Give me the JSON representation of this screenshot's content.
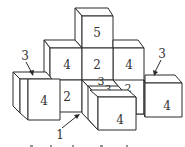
{
  "diagram": {
    "type": "isometric cube stack",
    "colors": {
      "stroke": "#2a2a2a",
      "fill": "#ffffff",
      "text": "#333333"
    },
    "cubes": [
      {
        "id": "top-center",
        "label": "5"
      },
      {
        "id": "middle-left",
        "label": "4"
      },
      {
        "id": "middle-center",
        "label": "2"
      },
      {
        "id": "middle-right",
        "label": "4"
      },
      {
        "id": "lower-center-left",
        "label": "2"
      },
      {
        "id": "far-left",
        "label": "4"
      },
      {
        "id": "far-right",
        "label": "4"
      },
      {
        "id": "front-center",
        "label": "4"
      }
    ],
    "top_labels": [
      {
        "id": "top-3-a",
        "label": "3"
      },
      {
        "id": "top-3-b",
        "label": "3"
      },
      {
        "id": "top-2",
        "label": "2"
      }
    ],
    "callouts": [
      {
        "id": "callout-left",
        "label": "3"
      },
      {
        "id": "callout-right",
        "label": "3"
      },
      {
        "id": "callout-bottom",
        "label": "1"
      }
    ]
  }
}
